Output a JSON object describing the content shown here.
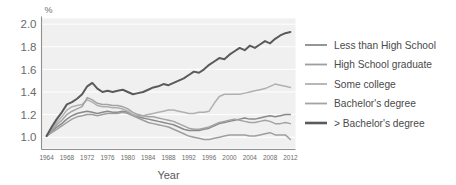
{
  "chart_data": {
    "type": "line",
    "title": "",
    "xlabel": "Year",
    "ylabel": "",
    "unit_label": "%",
    "xlim": [
      1963,
      2013
    ],
    "ylim": [
      0.9,
      2.05
    ],
    "yticks": [
      "2.0",
      "1.8",
      "1.6",
      "1.4",
      "1.2",
      "1.0"
    ],
    "ytick_values": [
      2.0,
      1.8,
      1.6,
      1.4,
      1.2,
      1.0
    ],
    "xticks": [
      "1964",
      "1968",
      "1972",
      "1976",
      "1980",
      "1984",
      "1988",
      "1992",
      "1996",
      "2000",
      "2004",
      "2008",
      "2012"
    ],
    "xtick_values": [
      1964,
      1968,
      1972,
      1976,
      1980,
      1984,
      1988,
      1992,
      1996,
      2000,
      2004,
      2008,
      2012
    ],
    "grid": "horizontal",
    "legend_position": "right",
    "plot_background": "#f0f0f0",
    "gridline_color": "#ffffff",
    "x": [
      1964,
      1965,
      1966,
      1967,
      1968,
      1969,
      1970,
      1971,
      1972,
      1973,
      1974,
      1975,
      1976,
      1977,
      1978,
      1979,
      1980,
      1981,
      1982,
      1983,
      1984,
      1985,
      1986,
      1987,
      1988,
      1989,
      1990,
      1991,
      1992,
      1993,
      1994,
      1995,
      1996,
      1997,
      1998,
      1999,
      2000,
      2001,
      2002,
      2003,
      2004,
      2005,
      2006,
      2007,
      2008,
      2009,
      2010,
      2011,
      2012
    ],
    "series": [
      {
        "name": "Less than High School",
        "color": "#8a8a8a",
        "width": 1.5,
        "values": [
          1.01,
          1.05,
          1.09,
          1.12,
          1.16,
          1.19,
          1.21,
          1.22,
          1.23,
          1.22,
          1.21,
          1.22,
          1.23,
          1.22,
          1.22,
          1.23,
          1.22,
          1.2,
          1.18,
          1.17,
          1.16,
          1.15,
          1.14,
          1.13,
          1.12,
          1.11,
          1.09,
          1.07,
          1.06,
          1.06,
          1.06,
          1.07,
          1.08,
          1.1,
          1.12,
          1.13,
          1.14,
          1.15,
          1.16,
          1.17,
          1.16,
          1.16,
          1.17,
          1.18,
          1.19,
          1.18,
          1.19,
          1.2,
          1.2
        ]
      },
      {
        "name": "High School graduate",
        "color": "#9e9e9e",
        "width": 1.5,
        "values": [
          1.01,
          1.04,
          1.07,
          1.1,
          1.13,
          1.16,
          1.18,
          1.19,
          1.2,
          1.2,
          1.19,
          1.2,
          1.21,
          1.21,
          1.21,
          1.22,
          1.21,
          1.19,
          1.17,
          1.15,
          1.13,
          1.12,
          1.11,
          1.1,
          1.09,
          1.07,
          1.05,
          1.03,
          1.01,
          1.0,
          0.99,
          0.98,
          0.98,
          0.99,
          1.0,
          1.01,
          1.02,
          1.02,
          1.02,
          1.02,
          1.01,
          1.01,
          1.02,
          1.03,
          1.04,
          1.02,
          1.02,
          1.02,
          0.98
        ]
      },
      {
        "name": "Some college",
        "color": "#b0b0b0",
        "width": 1.5,
        "values": [
          1.01,
          1.07,
          1.13,
          1.18,
          1.24,
          1.27,
          1.28,
          1.29,
          1.33,
          1.31,
          1.28,
          1.27,
          1.27,
          1.26,
          1.26,
          1.25,
          1.23,
          1.2,
          1.19,
          1.19,
          1.2,
          1.21,
          1.22,
          1.23,
          1.24,
          1.24,
          1.23,
          1.22,
          1.21,
          1.21,
          1.22,
          1.22,
          1.23,
          1.3,
          1.36,
          1.38,
          1.38,
          1.38,
          1.38,
          1.39,
          1.4,
          1.41,
          1.42,
          1.43,
          1.45,
          1.47,
          1.46,
          1.45,
          1.44
        ]
      },
      {
        "name": "Bachelor's degree",
        "color": "#a3a3a3",
        "width": 1.5,
        "values": [
          1.01,
          1.06,
          1.11,
          1.15,
          1.2,
          1.23,
          1.25,
          1.27,
          1.35,
          1.33,
          1.3,
          1.29,
          1.29,
          1.28,
          1.28,
          1.27,
          1.25,
          1.22,
          1.2,
          1.19,
          1.18,
          1.18,
          1.17,
          1.16,
          1.15,
          1.14,
          1.12,
          1.1,
          1.08,
          1.07,
          1.07,
          1.08,
          1.09,
          1.11,
          1.13,
          1.14,
          1.15,
          1.16,
          1.15,
          1.14,
          1.13,
          1.13,
          1.14,
          1.15,
          1.14,
          1.12,
          1.12,
          1.13,
          1.12
        ]
      },
      {
        "name": "> Bachelor's degree",
        "color": "#5a5a5a",
        "width": 2.0,
        "values": [
          1.01,
          1.09,
          1.16,
          1.22,
          1.29,
          1.31,
          1.34,
          1.38,
          1.45,
          1.48,
          1.43,
          1.4,
          1.41,
          1.4,
          1.41,
          1.42,
          1.4,
          1.38,
          1.39,
          1.4,
          1.42,
          1.44,
          1.45,
          1.47,
          1.46,
          1.48,
          1.5,
          1.52,
          1.55,
          1.58,
          1.57,
          1.6,
          1.64,
          1.67,
          1.7,
          1.69,
          1.73,
          1.76,
          1.79,
          1.77,
          1.81,
          1.79,
          1.82,
          1.85,
          1.83,
          1.87,
          1.9,
          1.92,
          1.93
        ]
      }
    ]
  },
  "legend": {
    "items": [
      {
        "label": "Less than High School",
        "color": "#8a8a8a",
        "width": 1.8
      },
      {
        "label": "High School graduate",
        "color": "#9e9e9e",
        "width": 1.8
      },
      {
        "label": "Some college",
        "color": "#b0b0b0",
        "width": 1.8
      },
      {
        "label": "Bachelor's degree",
        "color": "#a3a3a3",
        "width": 1.8
      },
      {
        "label": "> Bachelor's degree",
        "color": "#5a5a5a",
        "width": 2.6
      }
    ]
  }
}
